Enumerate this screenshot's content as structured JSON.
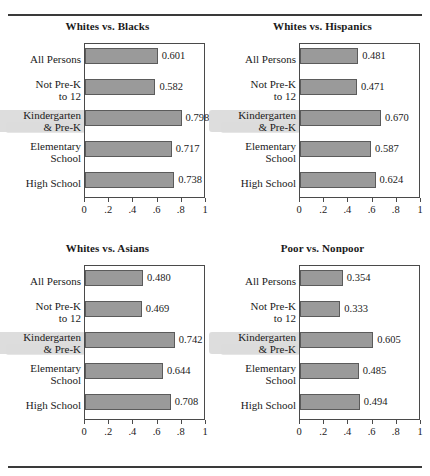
{
  "page": {
    "ghost_text": "",
    "rule_color": "#3a3a3a"
  },
  "style": {
    "bar_fill": "#9a9a9a",
    "bar_border": "#5b5b5b",
    "frame_color": "#4a4a4a",
    "highlight_color": "#d7d7d7"
  },
  "axis": {
    "ticks": [
      0,
      0.2,
      0.4,
      0.6,
      0.8,
      1
    ],
    "tick_labels": [
      "0",
      ".2",
      ".4",
      ".6",
      ".8",
      "1"
    ],
    "min": 0,
    "max": 1
  },
  "categories": [
    "All Persons",
    "Not Pre-K\nto 12",
    "Kindergarten\n& Pre-K",
    "Elementary\nSchool",
    "High School"
  ],
  "highlighted_category_index": 2,
  "chart_data": [
    {
      "type": "bar",
      "title": "Whites vs. Blacks",
      "orientation": "horizontal",
      "categories": [
        "All Persons",
        "Not Pre-K to 12",
        "Kindergarten & Pre-K",
        "Elementary School",
        "High School"
      ],
      "values": [
        0.601,
        0.582,
        0.798,
        0.717,
        0.738
      ],
      "value_labels": [
        "0.601",
        "0.582",
        "0.798",
        "0.717",
        "0.738"
      ],
      "xlabel": "",
      "ylabel": "",
      "xlim": [
        0,
        1
      ],
      "grid": false,
      "legend": "none"
    },
    {
      "type": "bar",
      "title": "Whites vs. Hispanics",
      "orientation": "horizontal",
      "categories": [
        "All Persons",
        "Not Pre-K to 12",
        "Kindergarten & Pre-K",
        "Elementary School",
        "High School"
      ],
      "values": [
        0.481,
        0.471,
        0.67,
        0.587,
        0.624
      ],
      "value_labels": [
        "0.481",
        "0.471",
        "0.670",
        "0.587",
        "0.624"
      ],
      "xlabel": "",
      "ylabel": "",
      "xlim": [
        0,
        1
      ],
      "grid": false,
      "legend": "none"
    },
    {
      "type": "bar",
      "title": "Whites vs. Asians",
      "orientation": "horizontal",
      "categories": [
        "All Persons",
        "Not Pre-K to 12",
        "Kindergarten & Pre-K",
        "Elementary School",
        "High School"
      ],
      "values": [
        0.48,
        0.469,
        0.742,
        0.644,
        0.708
      ],
      "value_labels": [
        "0.480",
        "0.469",
        "0.742",
        "0.644",
        "0.708"
      ],
      "xlabel": "",
      "ylabel": "",
      "xlim": [
        0,
        1
      ],
      "grid": false,
      "legend": "none"
    },
    {
      "type": "bar",
      "title": "Poor vs. Nonpoor",
      "orientation": "horizontal",
      "categories": [
        "All Persons",
        "Not Pre-K to 12",
        "Kindergarten & Pre-K",
        "Elementary School",
        "High School"
      ],
      "values": [
        0.354,
        0.333,
        0.605,
        0.485,
        0.494
      ],
      "value_labels": [
        "0.354",
        "0.333",
        "0.605",
        "0.485",
        "0.494"
      ],
      "xlabel": "",
      "ylabel": "",
      "xlim": [
        0,
        1
      ],
      "grid": false,
      "legend": "none"
    }
  ]
}
